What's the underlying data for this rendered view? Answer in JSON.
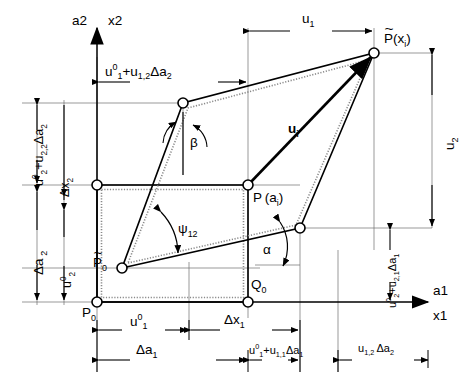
{
  "figure": {
    "type": "engineering-kinematics-diagram",
    "line_color": "#000000",
    "thin_line_color": "#6a6a6a",
    "dotted_color": "#8c8c8c",
    "background": "#ffffff"
  },
  "axes": {
    "vertical": {
      "material": "a2",
      "spatial": "x2"
    },
    "horizontal": {
      "material": "a1",
      "spatial": "x1"
    }
  },
  "points": {
    "p0": "P0",
    "q0": "Q0",
    "p0_tilde": "P0",
    "p_ai": "P (a_i)",
    "p_tilde_xi": "P (x_i)"
  },
  "point_labels": {
    "p0_base": "P",
    "p0_sub": "0",
    "q0_base": "Q",
    "q0_sub": "0",
    "p_tilde_base": "P",
    "p_tilde_sub": "0",
    "p_ai_base": "P",
    "p_ai_arg_open": "(a",
    "p_ai_arg_sub": "i",
    "p_ai_arg_close": ")",
    "p_xi_base": "P",
    "p_xi_arg_open": "(x",
    "p_xi_arg_sub": "i",
    "p_xi_arg_close": ")"
  },
  "angles": {
    "beta": "β",
    "psi12_base": "ψ",
    "psi12_sub": "12",
    "alpha": "α"
  },
  "vectors": {
    "ui_base": "u",
    "ui_sub": "i"
  },
  "dimensions": {
    "top_horizontal": {
      "u1_base": "u",
      "u1_sup": "0",
      "u1_sub": "1",
      "plus": "+",
      "u12_base": "u",
      "u12_sub": "1,2",
      "delta_a2": "Δa",
      "delta_a2_sub": "2"
    },
    "top_right_u1": {
      "base": "u",
      "sub": "1"
    },
    "right_u2": {
      "base": "u",
      "sub": "2"
    },
    "left_outer": {
      "u2_base": "u",
      "u2_sup": "0",
      "u2_sub": "2",
      "plus": "+",
      "u22_base": "u",
      "u22_sub": "2,2",
      "delta_a2": "Δa",
      "delta_a2_sub": "2"
    },
    "left_delta_x2": {
      "base": "Δx",
      "sub": "2"
    },
    "left_delta_a2": {
      "base": "Δa",
      "sub": "2"
    },
    "left_u2_zero": {
      "base": "u",
      "sup": "0",
      "sub": "2"
    },
    "bottom_u1_zero": {
      "base": "u",
      "sup": "0",
      "sub": "1"
    },
    "bottom_delta_x1": {
      "base": "Δx",
      "sub": "1"
    },
    "bottom_delta_a1": {
      "base": "Δa",
      "sub": "1"
    },
    "bottom_mid": {
      "u1_base": "u",
      "u1_sup": "0",
      "u1_sub": "1",
      "plus": "+",
      "u11_base": "u",
      "u11_sub": "1,1",
      "delta_a1": "Δa",
      "delta_a1_sub": "1"
    },
    "bottom_right": {
      "u12_base": "u",
      "u12_sub": "1,2",
      "delta_a2": "Δa",
      "delta_a2_sub": "2"
    },
    "right_outer": {
      "u2_base": "u",
      "u2_sup": "0",
      "u2_sub": "2",
      "plus": "+",
      "u21_base": "u",
      "u21_sub": "2,1",
      "delta_a1": "Δa",
      "delta_a1_sub": "1"
    }
  },
  "geometry": {
    "reference_rect": {
      "x1": 97,
      "y1": 185,
      "x2": 248,
      "y2": 302
    },
    "deformed_quad": [
      {
        "name": "P0_tilde",
        "x": 122,
        "y": 268
      },
      {
        "name": "Q0_disp",
        "x": 300,
        "y": 228
      },
      {
        "name": "P_xi_tilde",
        "x": 374,
        "y": 53
      },
      {
        "name": "upper_left",
        "x": 183,
        "y": 103
      }
    ],
    "axis_origin": {
      "x": 97,
      "y": 302
    }
  }
}
